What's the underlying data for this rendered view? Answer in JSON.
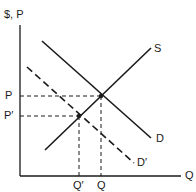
{
  "diagram": {
    "type": "supply-demand",
    "axes": {
      "y_label": "$, P",
      "x_label": "Q"
    },
    "curves": [
      {
        "name": "S",
        "label": "S",
        "style": "solid"
      },
      {
        "name": "D",
        "label": "D",
        "style": "solid"
      },
      {
        "name": "D-prime",
        "label": "D′",
        "style": "dashed"
      }
    ],
    "price_labels": {
      "p": "P",
      "p_prime": "P′"
    },
    "quantity_labels": {
      "q": "Q",
      "q_prime": "Q′"
    },
    "colors": {
      "line": "#1a1a1a",
      "background": "#ffffff"
    }
  }
}
